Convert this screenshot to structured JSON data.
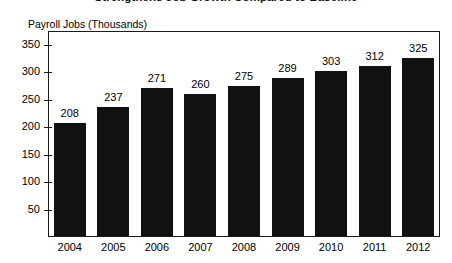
{
  "chart_data": {
    "type": "bar",
    "title": "Strengthens Job Growth Compared to Baseline",
    "ylabel": "Payroll Jobs (Thousands)",
    "xlabel": "",
    "categories": [
      "2004",
      "2005",
      "2006",
      "2007",
      "2008",
      "2009",
      "2010",
      "2011",
      "2012"
    ],
    "values": [
      208,
      237,
      271,
      260,
      275,
      289,
      303,
      312,
      325
    ],
    "value_labels": [
      "208",
      "237",
      "271",
      "260",
      "275",
      "289",
      "303",
      "312",
      "325"
    ],
    "yticks": [
      50,
      100,
      150,
      200,
      250,
      300,
      350
    ],
    "ytick_labels": [
      "50",
      "100",
      "150",
      "200",
      "250",
      "300",
      "350"
    ],
    "ylim": [
      0,
      375
    ],
    "grid": false,
    "legend": false,
    "legend_position": "none",
    "series_color": "#111111",
    "frame_color": "#1a1a1a",
    "background_color": "#ffffff"
  }
}
